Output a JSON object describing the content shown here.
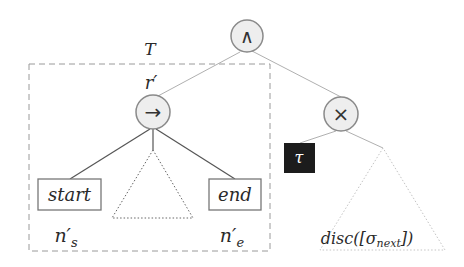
{
  "diagram": {
    "type": "tree",
    "root": {
      "id": "and",
      "symbol": "∧"
    },
    "nodes": [
      {
        "id": "seq",
        "symbol": "→",
        "label_above": "r′",
        "parent": "and"
      },
      {
        "id": "xor",
        "symbol": "×",
        "parent": "and"
      },
      {
        "id": "start",
        "label": "start",
        "sub_label": "n′",
        "sub_label_sub": "s",
        "parent": "seq"
      },
      {
        "id": "mid-subtree",
        "kind": "dotted-triangle",
        "parent": "seq"
      },
      {
        "id": "end",
        "label": "end",
        "sub_label": "n′",
        "sub_label_sub": "e",
        "parent": "seq"
      },
      {
        "id": "tau",
        "label": "τ",
        "kind": "silent-activity",
        "parent": "xor"
      },
      {
        "id": "disc-subtree",
        "kind": "dotted-triangle",
        "label": "disc([σ",
        "label_sub": "next",
        "label_end": "])",
        "parent": "xor"
      }
    ],
    "region": {
      "label": "T",
      "style": "dashed"
    }
  },
  "colors": {
    "node_fill": "#eeeeee",
    "node_stroke": "#8a8a8a",
    "edge": "#555555",
    "light_edge": "#aaaaaa",
    "tau_fill": "#1c1c1c",
    "tau_text": "#ffffff",
    "dashed": "#999999"
  }
}
